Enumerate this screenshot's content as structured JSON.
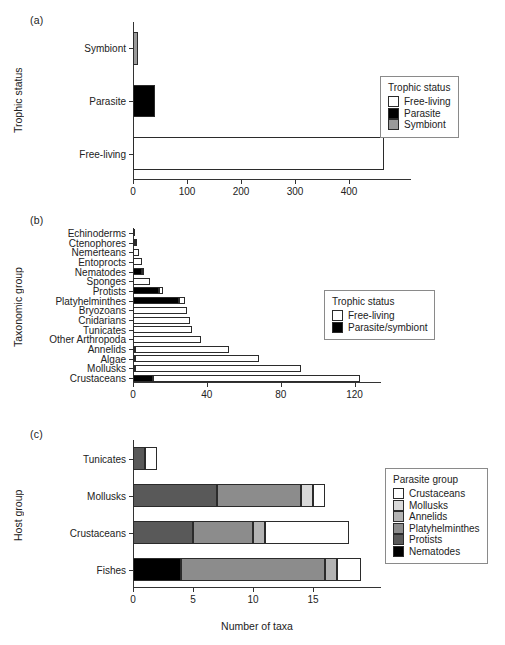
{
  "figure": {
    "panels": [
      "(a)",
      "(b)",
      "(c)"
    ]
  },
  "colors": {
    "free_living": "#ffffff",
    "parasite": "#000000",
    "symbiont": "#9a9a9a",
    "outline": "#2b2b2b",
    "crustaceans": "#ffffff",
    "mollusks": "#d9d9d9",
    "annelids": "#b3b3b3",
    "platyhelminthes": "#8c8c8c",
    "protists": "#595959",
    "nematodes": "#000000"
  },
  "panel_a": {
    "letter": "(a)",
    "ylabel": "Trophic status",
    "legend": {
      "title": "Trophic status",
      "items": [
        {
          "label": "Free-living",
          "color": "#ffffff"
        },
        {
          "label": "Parasite",
          "color": "#000000"
        },
        {
          "label": "Symbiont",
          "color": "#9a9a9a"
        }
      ]
    },
    "chart_data": {
      "type": "bar",
      "orientation": "horizontal",
      "title": "",
      "xlabel": "",
      "ylabel": "Trophic status",
      "categories": [
        "Symbiont",
        "Parasite",
        "Free-living"
      ],
      "values": [
        10,
        40,
        465
      ],
      "colors": [
        "#9a9a9a",
        "#000000",
        "#ffffff"
      ],
      "xlim": [
        0,
        500
      ],
      "xticks": [
        0,
        100,
        200,
        300,
        400
      ],
      "grid": false,
      "legend_position": "right"
    }
  },
  "panel_b": {
    "letter": "(b)",
    "ylabel": "Taxonomic group",
    "legend": {
      "title": "Trophic status",
      "items": [
        {
          "label": "Free-living",
          "color": "#ffffff"
        },
        {
          "label": "Parasite/symbiont",
          "color": "#000000"
        }
      ]
    },
    "chart_data": {
      "type": "bar",
      "orientation": "horizontal",
      "stacked": true,
      "title": "",
      "xlabel": "",
      "ylabel": "Taxonomic group",
      "categories": [
        "Echinoderms",
        "Ctenophores",
        "Nemerteans",
        "Entoprocts",
        "Nematodes",
        "Sponges",
        "Protists",
        "Platyhelminthes",
        "Bryozoans",
        "Cnidarians",
        "Tunicates",
        "Other Arthropoda",
        "Annelids",
        "Algae",
        "Mollusks",
        "Crustaceans"
      ],
      "series": [
        {
          "name": "Parasite/symbiont",
          "color": "#000000",
          "values": [
            1,
            1,
            0,
            0,
            5,
            0,
            14,
            25,
            0,
            0,
            0,
            0,
            1,
            1,
            1,
            11
          ]
        },
        {
          "name": "Free-living",
          "color": "#ffffff",
          "values": [
            0,
            1,
            3,
            5,
            1,
            9,
            2,
            3,
            29,
            31,
            32,
            37,
            51,
            67,
            90,
            112
          ]
        }
      ],
      "totals": [
        1,
        2,
        3,
        5,
        6,
        9,
        16,
        28,
        29,
        31,
        32,
        37,
        52,
        68,
        91,
        123
      ],
      "xlim": [
        0,
        130
      ],
      "xticks": [
        0,
        40,
        80,
        120
      ],
      "grid": false,
      "legend_position": "right"
    }
  },
  "panel_c": {
    "letter": "(c)",
    "ylabel": "Host group",
    "xlabel": "Number of taxa",
    "legend": {
      "title": "Parasite group",
      "items": [
        {
          "label": "Crustaceans",
          "color": "#ffffff"
        },
        {
          "label": "Mollusks",
          "color": "#d9d9d9"
        },
        {
          "label": "Annelids",
          "color": "#b3b3b3"
        },
        {
          "label": "Platyhelminthes",
          "color": "#8c8c8c"
        },
        {
          "label": "Protists",
          "color": "#595959"
        },
        {
          "label": "Nematodes",
          "color": "#000000"
        }
      ]
    },
    "chart_data": {
      "type": "bar",
      "orientation": "horizontal",
      "stacked": true,
      "title": "",
      "xlabel": "Number of taxa",
      "ylabel": "Host group",
      "categories": [
        "Tunicates",
        "Mollusks",
        "Crustaceans",
        "Fishes"
      ],
      "series": [
        {
          "name": "Nematodes",
          "color": "#000000",
          "values": [
            0,
            0,
            0,
            4
          ]
        },
        {
          "name": "Protists",
          "color": "#595959",
          "values": [
            1,
            7,
            5,
            0
          ]
        },
        {
          "name": "Platyhelminthes",
          "color": "#8c8c8c",
          "values": [
            0,
            7,
            5,
            12
          ]
        },
        {
          "name": "Annelids",
          "color": "#b3b3b3",
          "values": [
            0,
            0,
            1,
            1
          ]
        },
        {
          "name": "Mollusks",
          "color": "#d9d9d9",
          "values": [
            0,
            1,
            0,
            0
          ]
        },
        {
          "name": "Crustaceans",
          "color": "#ffffff",
          "values": [
            1,
            1,
            7,
            2
          ]
        }
      ],
      "totals": [
        2,
        16,
        18,
        19
      ],
      "xlim": [
        0,
        20
      ],
      "xticks": [
        0,
        5,
        10,
        15
      ],
      "grid": false,
      "legend_position": "right"
    }
  }
}
